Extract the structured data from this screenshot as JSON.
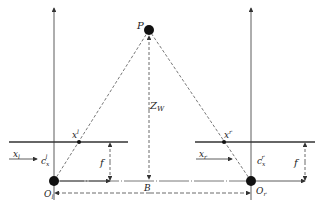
{
  "diagram": {
    "colors": {
      "line": "#333333",
      "fill": "#111111",
      "background": "#ffffff"
    },
    "labels": {
      "point": "P",
      "depth": "Z",
      "depth_sub": "W",
      "left_image_point": "x",
      "left_image_point_sup": "l",
      "right_image_point": "x",
      "right_image_point_sup": "r",
      "left_axis": "x",
      "left_axis_sub": "l",
      "right_axis": "x",
      "right_axis_sub": "r",
      "left_principal": "c",
      "left_principal_sub": "x",
      "left_principal_sup": "l",
      "right_principal": "c",
      "right_principal_sub": "x",
      "right_principal_sup": "r",
      "focal_left": "f",
      "focal_right": "f",
      "baseline": "B",
      "left_origin": "O",
      "left_origin_sub": "l",
      "right_origin": "O",
      "right_origin_sub": "r"
    }
  }
}
